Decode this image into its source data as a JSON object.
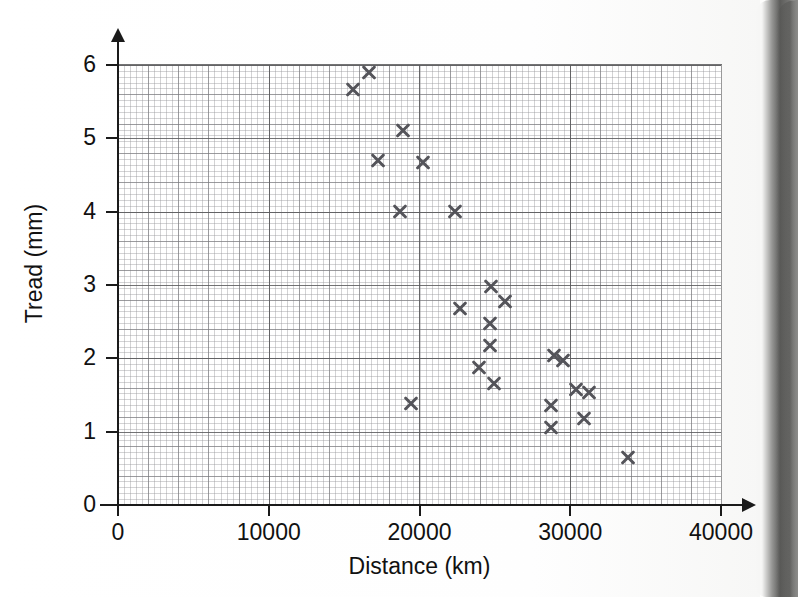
{
  "chart_data": {
    "type": "scatter",
    "title": "",
    "xlabel": "Distance (km)",
    "ylabel": "Tread (mm)",
    "xlim": [
      0,
      40000
    ],
    "ylim": [
      0,
      6
    ],
    "xticks": [
      0,
      10000,
      20000,
      30000,
      40000
    ],
    "xtick_labels": [
      "0",
      "10000",
      "20000",
      "30000",
      "40000"
    ],
    "yticks": [
      0,
      1,
      2,
      3,
      4,
      5,
      6
    ],
    "ytick_labels": [
      "0",
      "1",
      "2",
      "3",
      "4",
      "5",
      "6"
    ],
    "grid": true,
    "grid_style": "graph-paper, minor squares with 5x major blocks",
    "marker": "x-cross",
    "marker_color": "#54545a",
    "series": [
      {
        "name": "Tyre tread measurements",
        "points": [
          {
            "x": 15600,
            "y": 5.67
          },
          {
            "x": 16650,
            "y": 5.9
          },
          {
            "x": 18900,
            "y": 5.1
          },
          {
            "x": 17250,
            "y": 4.7
          },
          {
            "x": 20200,
            "y": 4.67
          },
          {
            "x": 18700,
            "y": 4.0
          },
          {
            "x": 22350,
            "y": 4.0
          },
          {
            "x": 24750,
            "y": 2.98
          },
          {
            "x": 25700,
            "y": 2.78
          },
          {
            "x": 22700,
            "y": 2.68
          },
          {
            "x": 24700,
            "y": 2.47
          },
          {
            "x": 24700,
            "y": 2.17
          },
          {
            "x": 28950,
            "y": 2.04
          },
          {
            "x": 29500,
            "y": 1.97
          },
          {
            "x": 23950,
            "y": 1.88
          },
          {
            "x": 24950,
            "y": 1.66
          },
          {
            "x": 30350,
            "y": 1.57
          },
          {
            "x": 31250,
            "y": 1.54
          },
          {
            "x": 19450,
            "y": 1.38
          },
          {
            "x": 28700,
            "y": 1.36
          },
          {
            "x": 30900,
            "y": 1.18
          },
          {
            "x": 28750,
            "y": 1.05
          },
          {
            "x": 33850,
            "y": 0.65
          }
        ]
      }
    ]
  },
  "axes": {
    "x_title": "Distance (km)",
    "y_title": "Tread (mm)"
  }
}
